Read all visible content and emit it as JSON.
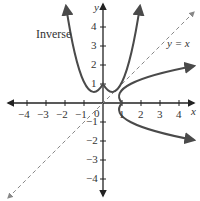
{
  "figure": {
    "curve_label": "Inverse",
    "line_label": "y = x",
    "x_axis_label": "x",
    "y_axis_label": "y",
    "origin_label": "0",
    "x_ticks": [
      "−4",
      "−3",
      "−2",
      "−1",
      "1",
      "2",
      "3",
      "4"
    ],
    "y_ticks": [
      "4",
      "3",
      "2",
      "1",
      "−1",
      "−2",
      "−3",
      "−4"
    ],
    "colors": {
      "curve": "#4a4a4a",
      "axis": "#222222",
      "dashed_line": "#888888"
    }
  }
}
